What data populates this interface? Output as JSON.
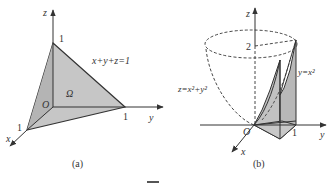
{
  "figure": {
    "panels": [
      {
        "id": "a",
        "caption": "(a)",
        "axes": {
          "x": "x",
          "y": "y",
          "z": "z",
          "origin": "O"
        },
        "intercepts": {
          "x": "1",
          "y": "1",
          "z": "1"
        },
        "plane_label": "x+y+z=1",
        "region_label": "Ω",
        "fill_color": "#c8c8c8"
      },
      {
        "id": "b",
        "caption": "(b)",
        "axes": {
          "x": "x",
          "y": "y",
          "z": "z",
          "origin": "O"
        },
        "z_tick": "2",
        "y_tick": "1",
        "surface_label": "z=x²+y²",
        "curve_label": "y=x²",
        "fill_color": "#c8c8c8"
      }
    ],
    "footer_fragment": "图"
  }
}
